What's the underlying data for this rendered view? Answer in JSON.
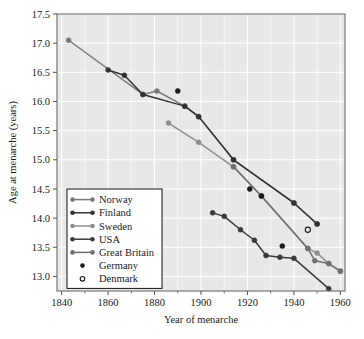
{
  "chart_data": {
    "type": "line",
    "title": "",
    "xlabel": "Year of menarche",
    "ylabel": "Age at menarche (years)",
    "xlim": [
      1838,
      1962
    ],
    "ylim": [
      12.75,
      17.5
    ],
    "xticks": [
      1840,
      1860,
      1880,
      1900,
      1920,
      1940,
      1960
    ],
    "xtick_labels": [
      "1840",
      "1860",
      "1880",
      "1900",
      "1920",
      "1940",
      "1960"
    ],
    "xminorticks": [
      1850,
      1870,
      1890,
      1910,
      1930,
      1950
    ],
    "yticks": [
      13.0,
      13.5,
      14.0,
      14.5,
      15.0,
      15.5,
      16.0,
      16.5,
      17.0,
      17.5
    ],
    "ytick_labels": [
      "13.0",
      "13.5",
      "14.0",
      "14.5",
      "15.0",
      "15.5",
      "16.0",
      "16.5",
      "17.0",
      "17.5"
    ],
    "grid": true,
    "legend_position": "lower-left-inside",
    "plot_background": "#e8e8e8",
    "grid_color": "#ffffff",
    "series": [
      {
        "name": "Norway",
        "style": "line-marker",
        "color": "#7a7a7a",
        "marker": "filled-circle",
        "points": [
          {
            "x": 1843,
            "y": 17.05
          },
          {
            "x": 1875,
            "y": 16.12
          },
          {
            "x": 1881,
            "y": 16.18
          },
          {
            "x": 1893,
            "y": 15.92
          },
          {
            "x": 1899,
            "y": 15.74
          },
          {
            "x": 1914,
            "y": 15.0
          },
          {
            "x": 1940,
            "y": 14.26
          },
          {
            "x": 1950,
            "y": 13.9
          }
        ]
      },
      {
        "name": "Finland",
        "style": "line-marker",
        "color": "#333333",
        "marker": "filled-circle",
        "points": [
          {
            "x": 1860,
            "y": 16.54
          },
          {
            "x": 1867,
            "y": 16.45
          },
          {
            "x": 1875,
            "y": 16.12
          },
          {
            "x": 1893,
            "y": 15.92
          },
          {
            "x": 1899,
            "y": 15.74
          },
          {
            "x": 1914,
            "y": 15.0
          },
          {
            "x": 1940,
            "y": 14.26
          },
          {
            "x": 1950,
            "y": 13.9
          }
        ]
      },
      {
        "name": "Sweden",
        "style": "line-marker",
        "color": "#8f8f8f",
        "marker": "filled-circle",
        "points": [
          {
            "x": 1886,
            "y": 15.63
          },
          {
            "x": 1899,
            "y": 15.3
          },
          {
            "x": 1914,
            "y": 14.88
          },
          {
            "x": 1926,
            "y": 14.38
          },
          {
            "x": 1946,
            "y": 13.48
          },
          {
            "x": 1950,
            "y": 13.4
          },
          {
            "x": 1955,
            "y": 13.22
          },
          {
            "x": 1960,
            "y": 13.09
          }
        ]
      },
      {
        "name": "USA",
        "style": "line-marker",
        "color": "#3a3a3a",
        "marker": "filled-circle",
        "points": [
          {
            "x": 1905,
            "y": 14.09
          },
          {
            "x": 1910,
            "y": 14.03
          },
          {
            "x": 1917,
            "y": 13.8
          },
          {
            "x": 1923,
            "y": 13.62
          },
          {
            "x": 1928,
            "y": 13.36
          },
          {
            "x": 1934,
            "y": 13.33
          },
          {
            "x": 1940,
            "y": 13.31
          },
          {
            "x": 1955,
            "y": 12.79
          }
        ]
      },
      {
        "name": "Great Britain",
        "style": "line-marker",
        "color": "#6f6f6f",
        "marker": "filled-circle",
        "points": [
          {
            "x": 1914,
            "y": 14.88
          },
          {
            "x": 1926,
            "y": 14.38
          },
          {
            "x": 1946,
            "y": 13.48
          },
          {
            "x": 1949,
            "y": 13.27
          },
          {
            "x": 1955,
            "y": 13.22
          },
          {
            "x": 1960,
            "y": 13.09
          }
        ]
      },
      {
        "name": "Germany",
        "style": "marker-only",
        "color": "#1a1a1a",
        "marker": "filled-circle",
        "points": [
          {
            "x": 1890,
            "y": 16.18
          },
          {
            "x": 1921,
            "y": 14.5
          },
          {
            "x": 1926,
            "y": 14.38
          },
          {
            "x": 1935,
            "y": 13.52
          }
        ]
      },
      {
        "name": "Denmark",
        "style": "marker-only",
        "color": "#1a1a1a",
        "marker": "open-circle",
        "points": [
          {
            "x": 1946,
            "y": 13.8
          }
        ]
      }
    ],
    "legend_entries": [
      {
        "label": "Norway",
        "marker": "line-marker",
        "color": "#7a7a7a"
      },
      {
        "label": "Finland",
        "marker": "line-marker",
        "color": "#333333"
      },
      {
        "label": "Sweden",
        "marker": "line-marker",
        "color": "#8f8f8f"
      },
      {
        "label": "USA",
        "marker": "line-marker",
        "color": "#3a3a3a"
      },
      {
        "label": "Great Britain",
        "marker": "line-marker",
        "color": "#6f6f6f"
      },
      {
        "label": "Germany",
        "marker": "filled-circle",
        "color": "#1a1a1a"
      },
      {
        "label": "Denmark",
        "marker": "open-circle",
        "color": "#1a1a1a"
      }
    ]
  }
}
